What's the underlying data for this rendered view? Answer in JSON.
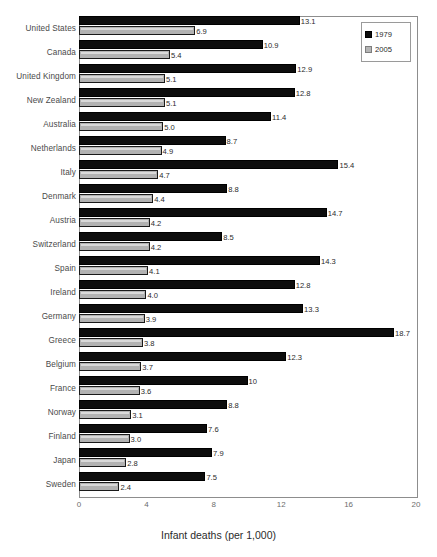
{
  "chart_data": {
    "type": "bar",
    "orientation": "horizontal",
    "title": "",
    "xlabel": "Infant deaths (per 1,000)",
    "ylabel": "",
    "xlim": [
      0,
      20
    ],
    "xticks": [
      "0",
      "4",
      "8",
      "12",
      "16",
      "20"
    ],
    "grid": false,
    "legend_position": "top-right",
    "categories": [
      "United States",
      "Canada",
      "United Kingdom",
      "New Zealand",
      "Australia",
      "Netherlands",
      "Italy",
      "Denmark",
      "Austria",
      "Switzerland",
      "Spain",
      "Ireland",
      "Germany",
      "Greece",
      "Belgium",
      "France",
      "Norway",
      "Finland",
      "Japan",
      "Sweden"
    ],
    "series": [
      {
        "name": "1979",
        "color": "#0d0d0d",
        "values": [
          13.1,
          10.9,
          12.9,
          12.8,
          11.4,
          8.7,
          15.4,
          8.8,
          14.7,
          8.5,
          14.3,
          12.8,
          13.3,
          18.7,
          12.3,
          10,
          8.8,
          7.6,
          7.9,
          7.5
        ],
        "labels": [
          "13.1",
          "10.9",
          "12.9",
          "12.8",
          "11.4",
          "8.7",
          "15.4",
          "8.8",
          "14.7",
          "8.5",
          "14.3",
          "12.8",
          "13.3",
          "18.7",
          "12.3",
          "10",
          "8.8",
          "7.6",
          "7.9",
          "7.5"
        ]
      },
      {
        "name": "2005",
        "color": "#b2b2b2",
        "values": [
          6.9,
          5.4,
          5.1,
          5.1,
          5.0,
          4.9,
          4.7,
          4.4,
          4.2,
          4.2,
          4.1,
          4.0,
          3.9,
          3.8,
          3.7,
          3.6,
          3.1,
          3.0,
          2.8,
          2.4
        ],
        "labels": [
          "6.9",
          "5.4",
          "5.1",
          "5.1",
          "5.0",
          "4.9",
          "4.7",
          "4.4",
          "4.2",
          "4.2",
          "4.1",
          "4.0",
          "3.9",
          "3.8",
          "3.7",
          "3.6",
          "3.1",
          "3.0",
          "2.8",
          "2.4"
        ]
      }
    ]
  },
  "legend": {
    "items": [
      {
        "label": "1979",
        "swatch": "black-square-icon"
      },
      {
        "label": "2005",
        "swatch": "gray-square-icon"
      }
    ]
  }
}
